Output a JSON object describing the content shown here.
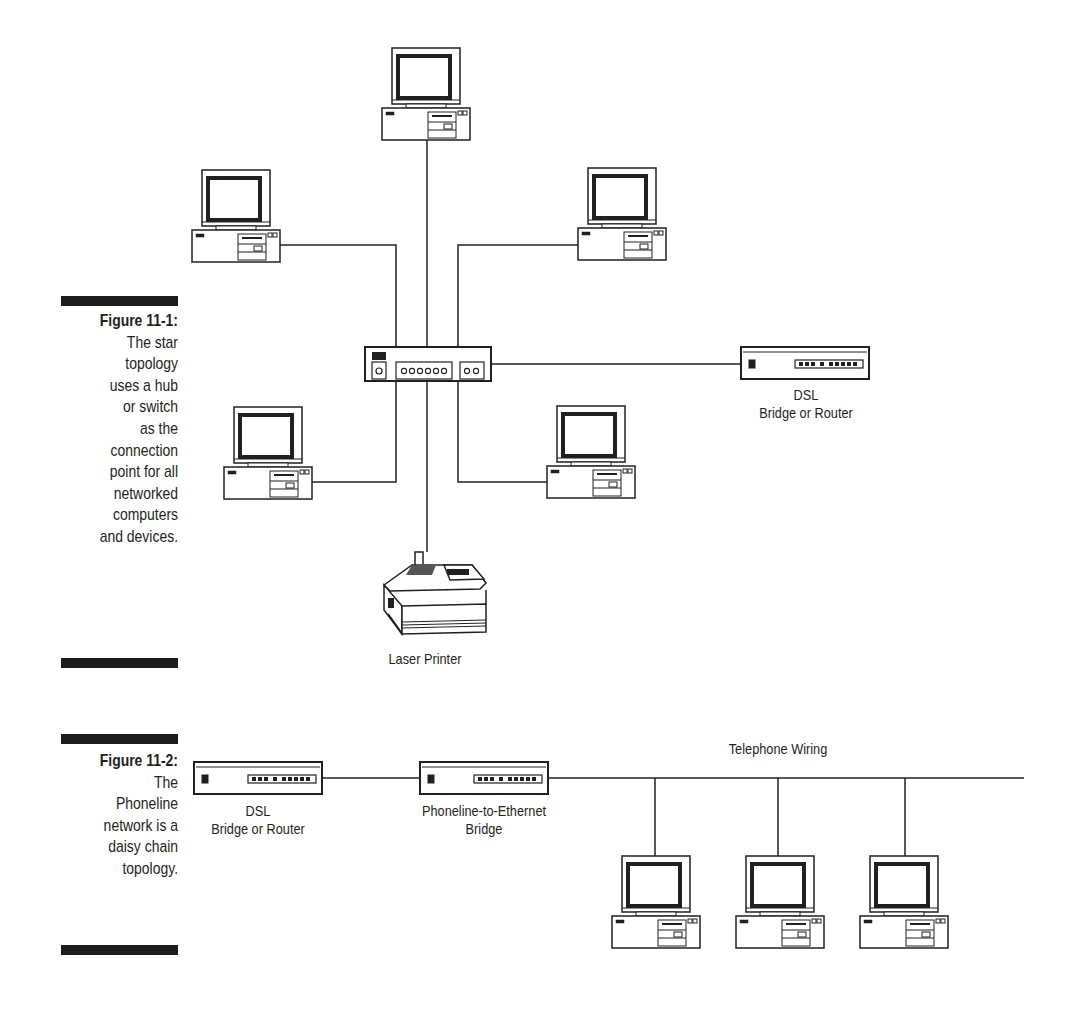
{
  "figures": [
    {
      "number": "Figure 11-1:",
      "caption_lines": [
        "The star",
        "topology",
        "uses a hub",
        "or switch",
        "as the",
        "connection",
        "point for all",
        "networked",
        "computers",
        "and devices."
      ],
      "topology": "star",
      "hub_label": "",
      "nodes": [
        {
          "type": "computer",
          "position": "top"
        },
        {
          "type": "computer",
          "position": "upper-left"
        },
        {
          "type": "computer",
          "position": "upper-right"
        },
        {
          "type": "computer",
          "position": "lower-left"
        },
        {
          "type": "computer",
          "position": "lower-right"
        },
        {
          "type": "printer",
          "label": "Laser Printer"
        },
        {
          "type": "dsl-device",
          "label_line1": "DSL",
          "label_line2": "Bridge or Router"
        }
      ]
    },
    {
      "number": "Figure 11-2:",
      "caption_lines": [
        "The",
        "Phoneline",
        "network is a",
        "daisy chain",
        "topology."
      ],
      "topology": "daisy-chain",
      "wiring_label": "Telephone Wiring",
      "nodes": [
        {
          "type": "dsl-device",
          "label_line1": "DSL",
          "label_line2": "Bridge or Router"
        },
        {
          "type": "bridge",
          "label_line1": "Phoneline-to-Ethernet",
          "label_line2": "Bridge"
        },
        {
          "type": "computer"
        },
        {
          "type": "computer"
        },
        {
          "type": "computer"
        }
      ]
    }
  ],
  "colors": {
    "ink": "#231f20",
    "background": "#ffffff"
  }
}
